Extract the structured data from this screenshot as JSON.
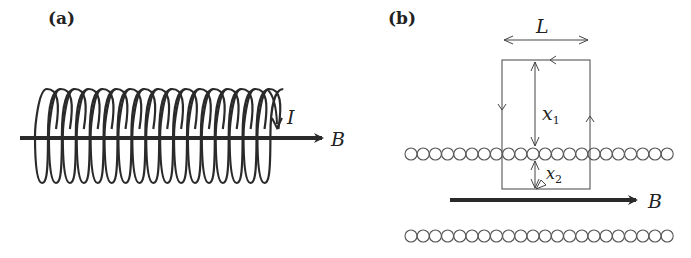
{
  "panels": {
    "a": {
      "label": "(a)",
      "current_label": "I",
      "field_label": "B",
      "coil_turns": 17
    },
    "b": {
      "label": "(b)",
      "length_label": "L",
      "distance1_label": "x",
      "distance1_sub": "1",
      "distance2_label": "x",
      "distance2_sub": "2",
      "field_label": "B",
      "wire_count_per_row": 22
    }
  },
  "colors": {
    "ink": "#2a2a2a",
    "thin_line": "#444444",
    "background": "#ffffff"
  }
}
